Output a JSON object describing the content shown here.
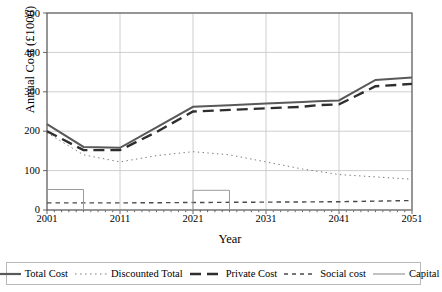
{
  "chart_data": {
    "type": "line",
    "title": "",
    "xlabel": "Year",
    "ylabel": "Annual Cost (£1000)",
    "xlim": [
      2001,
      2051
    ],
    "ylim": [
      0,
      500
    ],
    "ytick_labels": [
      "0",
      "100",
      "200",
      "300",
      "400",
      "500"
    ],
    "ytick_values": [
      0,
      100,
      200,
      300,
      400,
      500
    ],
    "xtick_labels": [
      "2001",
      "2011",
      "2021",
      "2031",
      "2041",
      "2051"
    ],
    "xtick_values": [
      2001,
      2011,
      2021,
      2031,
      2041,
      2051
    ],
    "grid": "both",
    "legend_position": "bottom-outside",
    "series": [
      {
        "name": "Total Cost",
        "style": "solid",
        "color": "#595959",
        "width": 2.0,
        "x": [
          2001,
          2006,
          2011,
          2016,
          2021,
          2026,
          2031,
          2036,
          2038,
          2041,
          2046,
          2051
        ],
        "values": [
          218,
          160,
          158,
          210,
          262,
          266,
          270,
          274,
          276,
          278,
          330,
          336
        ]
      },
      {
        "name": "Discounted Total",
        "style": "dotted",
        "color": "#7a7a7a",
        "width": 1.0,
        "x": [
          2001,
          2006,
          2011,
          2016,
          2021,
          2026,
          2031,
          2036,
          2041,
          2046,
          2051
        ],
        "values": [
          196,
          140,
          122,
          138,
          148,
          140,
          122,
          104,
          90,
          84,
          78
        ]
      },
      {
        "name": "Private Cost",
        "style": "dashed",
        "color": "#2e2e2e",
        "width": 2.4,
        "x": [
          2001,
          2006,
          2011,
          2016,
          2021,
          2026,
          2031,
          2036,
          2038,
          2041,
          2046,
          2051
        ],
        "values": [
          200,
          152,
          152,
          198,
          250,
          254,
          258,
          262,
          266,
          268,
          314,
          320
        ]
      },
      {
        "name": "Social cost",
        "style": "dash-dot",
        "color": "#4a4a4a",
        "width": 1.4,
        "x": [
          2001,
          2011,
          2021,
          2031,
          2041,
          2051
        ],
        "values": [
          18,
          18,
          19,
          20,
          21,
          24
        ]
      },
      {
        "name": "Capital",
        "style": "solid-step",
        "color": "#9a9a9a",
        "width": 1.0,
        "x": [
          2001,
          2006,
          2006,
          2021,
          2021,
          2026,
          2026,
          2051
        ],
        "values": [
          52,
          52,
          0,
          0,
          50,
          50,
          0,
          0
        ]
      }
    ]
  }
}
